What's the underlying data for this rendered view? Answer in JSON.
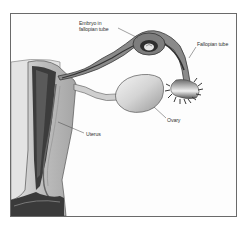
{
  "figure": {
    "labels": {
      "embryo_line1": "Embryo in",
      "embryo_line2": "fallopian tube",
      "fallopian_tube": "Fallopian tube",
      "ovary": "Ovary",
      "uterus": "Uterus"
    },
    "colors": {
      "border": "#6a6a6a",
      "dark_tissue": "#3a3a3a",
      "mid_tissue": "#8c8c8c",
      "light_tissue": "#c8c8c8",
      "ovary_fill": "#d6d6d6",
      "background": "#ffffff"
    }
  }
}
